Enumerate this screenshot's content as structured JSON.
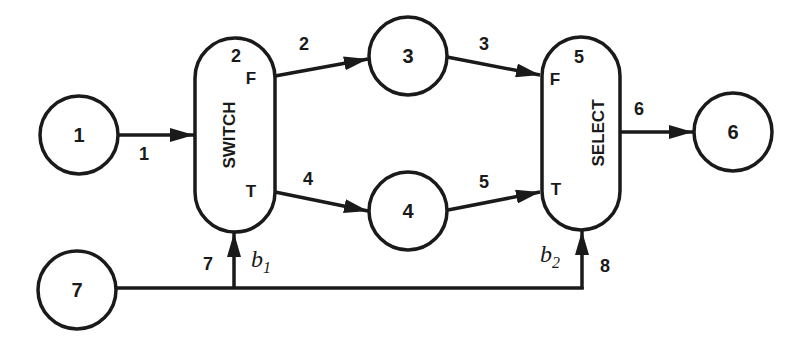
{
  "diagram": {
    "type": "dataflow-graph",
    "colors": {
      "stroke": "#1a1a1a",
      "background": "#ffffff"
    },
    "nodes": [
      {
        "id": "1",
        "label": "1",
        "shape": "circle"
      },
      {
        "id": "3",
        "label": "3",
        "shape": "circle"
      },
      {
        "id": "4",
        "label": "4",
        "shape": "circle"
      },
      {
        "id": "6",
        "label": "6",
        "shape": "circle"
      },
      {
        "id": "7",
        "label": "7",
        "shape": "circle"
      },
      {
        "id": "switch",
        "label": "SWITCH",
        "number": "2",
        "shape": "pill",
        "ports": {
          "false": "F",
          "true": "T"
        },
        "control_label": "b",
        "control_sub": "1"
      },
      {
        "id": "select",
        "label": "SELECT",
        "number": "5",
        "shape": "pill",
        "ports": {
          "false": "F",
          "true": "T"
        },
        "control_label": "b",
        "control_sub": "2"
      }
    ],
    "edges": [
      {
        "id": "1",
        "label": "1",
        "from": "1",
        "to": "switch"
      },
      {
        "id": "2",
        "label": "2",
        "from": "switch.F",
        "to": "3"
      },
      {
        "id": "3",
        "label": "3",
        "from": "3",
        "to": "select.F"
      },
      {
        "id": "4",
        "label": "4",
        "from": "switch.T",
        "to": "4"
      },
      {
        "id": "5",
        "label": "5",
        "from": "4",
        "to": "select.T"
      },
      {
        "id": "6",
        "label": "6",
        "from": "select",
        "to": "6"
      },
      {
        "id": "7",
        "label": "7",
        "from": "7",
        "to": "switch.control"
      },
      {
        "id": "8",
        "label": "8",
        "from": "7",
        "to": "select.control"
      }
    ]
  }
}
